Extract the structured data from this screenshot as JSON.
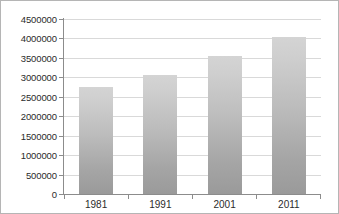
{
  "chart_data": {
    "type": "bar",
    "title": "",
    "subtitle": "",
    "xlabel": "",
    "ylabel": "",
    "categories": [
      "1981",
      "1991",
      "2001",
      "2011"
    ],
    "values": [
      2750000,
      3050000,
      3550000,
      4050000
    ],
    "series": [
      {
        "name": "",
        "values": [
          2750000,
          3050000,
          3550000,
          4050000
        ]
      }
    ],
    "ylim": [
      0,
      4500000
    ],
    "ytick_step": 500000,
    "ytick_labels": [
      "4500000",
      "4000000",
      "3500000",
      "3000000",
      "2500000",
      "2000000",
      "1500000",
      "1000000",
      "500000",
      "0"
    ],
    "ytick_values": [
      4500000,
      4000000,
      3500000,
      3000000,
      2500000,
      2000000,
      1500000,
      1000000,
      500000,
      0
    ],
    "grid": true,
    "legend": false,
    "legend_position": "none",
    "annotations": [],
    "colors": {
      "bar_top": "#d4d4d4",
      "bar_bottom": "#9a9a9a",
      "gridline": "#d9d9d9",
      "axis": "#8c8c8c",
      "text": "#2b2b2b",
      "background": "#ffffff",
      "border": "#b5b5b5"
    }
  }
}
